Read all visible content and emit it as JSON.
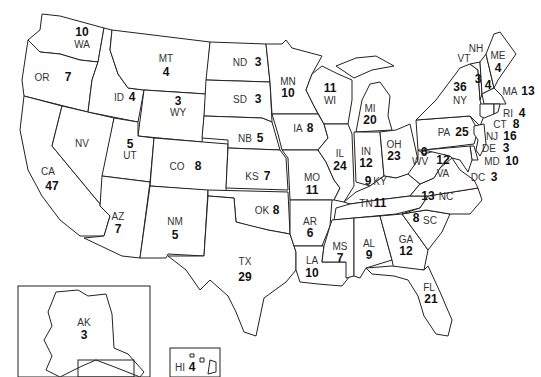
{
  "states": [
    {
      "abbr": "WA",
      "votes": 10
    },
    {
      "abbr": "OR",
      "votes": 7
    },
    {
      "abbr": "CA",
      "votes": 47
    },
    {
      "abbr": "ID",
      "votes": 4
    },
    {
      "abbr": "NV",
      "votes": null
    },
    {
      "abbr": "MT",
      "votes": 4
    },
    {
      "abbr": "WY",
      "votes": 3
    },
    {
      "abbr": "UT",
      "votes": 5
    },
    {
      "abbr": "CO",
      "votes": 8
    },
    {
      "abbr": "AZ",
      "votes": 7
    },
    {
      "abbr": "NM",
      "votes": 5
    },
    {
      "abbr": "ND",
      "votes": 3
    },
    {
      "abbr": "SD",
      "votes": 3
    },
    {
      "abbr": "NB",
      "votes": 5
    },
    {
      "abbr": "KS",
      "votes": 7
    },
    {
      "abbr": "OK",
      "votes": 8
    },
    {
      "abbr": "TX",
      "votes": 29
    },
    {
      "abbr": "MN",
      "votes": 10
    },
    {
      "abbr": "IA",
      "votes": 8
    },
    {
      "abbr": "MO",
      "votes": 11
    },
    {
      "abbr": "AR",
      "votes": 6
    },
    {
      "abbr": "LA",
      "votes": 10
    },
    {
      "abbr": "WI",
      "votes": 11
    },
    {
      "abbr": "IL",
      "votes": 24
    },
    {
      "abbr": "MI",
      "votes": 20
    },
    {
      "abbr": "IN",
      "votes": 12
    },
    {
      "abbr": "OH",
      "votes": 23
    },
    {
      "abbr": "KY",
      "votes": 9
    },
    {
      "abbr": "TN",
      "votes": 11
    },
    {
      "abbr": "MS",
      "votes": 7
    },
    {
      "abbr": "AL",
      "votes": 9
    },
    {
      "abbr": "GA",
      "votes": 12
    },
    {
      "abbr": "FL",
      "votes": 21
    },
    {
      "abbr": "SC",
      "votes": 8
    },
    {
      "abbr": "NC",
      "votes": 13
    },
    {
      "abbr": "VA",
      "votes": 12
    },
    {
      "abbr": "WV",
      "votes": 6
    },
    {
      "abbr": "PA",
      "votes": 25
    },
    {
      "abbr": "NY",
      "votes": 36
    },
    {
      "abbr": "VT",
      "votes": 3
    },
    {
      "abbr": "NH",
      "votes": 4
    },
    {
      "abbr": "ME",
      "votes": 4
    },
    {
      "abbr": "MA",
      "votes": 13
    },
    {
      "abbr": "RI",
      "votes": 4
    },
    {
      "abbr": "CT",
      "votes": 8
    },
    {
      "abbr": "NJ",
      "votes": 16
    },
    {
      "abbr": "DE",
      "votes": 3
    },
    {
      "abbr": "MD",
      "votes": 10
    },
    {
      "abbr": "DC",
      "votes": 3
    },
    {
      "abbr": "AK",
      "votes": 3
    },
    {
      "abbr": "HI",
      "votes": 4
    }
  ]
}
